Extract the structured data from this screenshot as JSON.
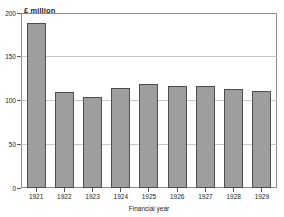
{
  "chart_data": {
    "type": "bar",
    "title": "",
    "subtitle": "",
    "xlabel": "Financial year",
    "ylabel": "£ million",
    "unit_caption": "£ million",
    "categories": [
      "1921",
      "1922",
      "1923",
      "1924",
      "1925",
      "1926",
      "1927",
      "1928",
      "1929"
    ],
    "values": [
      190,
      110,
      105,
      115,
      119,
      117,
      117,
      114,
      112
    ],
    "ylim": [
      0,
      200
    ],
    "yticks": [
      0,
      50,
      100,
      150,
      200
    ],
    "ytick_labels": [
      "0",
      "50",
      "100",
      "150",
      "200"
    ],
    "grid": "horizontal",
    "legend": "none",
    "series": [
      {
        "name": "",
        "values": [
          190,
          110,
          105,
          115,
          119,
          117,
          117,
          114,
          112
        ]
      }
    ]
  },
  "style": {
    "bar_fill": "#9e9e9e",
    "bar_stroke": "#4d4d4d",
    "gridline_color": "#c9c9c9",
    "frame_color": "#8d8d8d",
    "text_color": "#1a1a1a",
    "background": "#ffffff"
  }
}
